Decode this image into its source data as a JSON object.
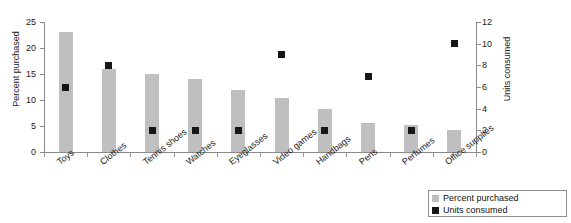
{
  "chart_data": {
    "type": "bar",
    "title": "",
    "categories": [
      "Toys",
      "Clothes",
      "Tennis shoes",
      "Watches",
      "Eyeglasses",
      "Video games",
      "Handbags",
      "Pens",
      "Perfumes",
      "Office supplies"
    ],
    "series": [
      {
        "name": "Percent purchased",
        "type": "bar",
        "axis": "left",
        "color": "#bfbfbf",
        "values": [
          23,
          16,
          15,
          14,
          12,
          10.3,
          8.3,
          5.5,
          5.2,
          4.2
        ]
      },
      {
        "name": "Units consumed",
        "type": "scatter",
        "axis": "right",
        "color": "#161616",
        "values": [
          6,
          8,
          2,
          2,
          2,
          9,
          2,
          7,
          2,
          10
        ]
      }
    ],
    "xlabel": "",
    "ylabel": "Percent purchased",
    "y2label": "Units consumed",
    "ylim": [
      0,
      25
    ],
    "y2lim": [
      0,
      12
    ],
    "yticks": [
      0,
      5,
      10,
      15,
      20,
      25
    ],
    "y2ticks": [
      0,
      2,
      4,
      6,
      8,
      10,
      12
    ],
    "grid": false,
    "legend_position": "bottom-right",
    "legend": [
      "Percent purchased",
      "Units consumed"
    ]
  },
  "axes": {
    "left_title": "Percent purchased",
    "right_title": "Units consumed",
    "left_ticks": [
      "0",
      "5",
      "10",
      "15",
      "20",
      "25"
    ],
    "right_ticks": [
      "0",
      "2",
      "4",
      "6",
      "8",
      "10",
      "12"
    ]
  },
  "legend": {
    "items": [
      {
        "label": "Percent purchased",
        "swatch": "pct"
      },
      {
        "label": "Units consumed",
        "swatch": "units"
      }
    ]
  }
}
